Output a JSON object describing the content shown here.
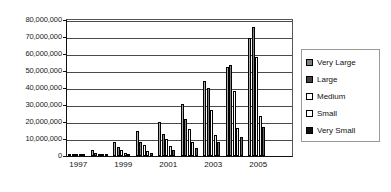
{
  "chart_data": {
    "type": "bar",
    "title": "",
    "subtitle": "",
    "xlabel": "",
    "ylabel": "",
    "grid": true,
    "legend_position": "right",
    "categories": [
      "1997",
      "1998",
      "1999",
      "2000",
      "2001",
      "2002",
      "2003",
      "2004",
      "2005",
      "2006"
    ],
    "tick_labels_shown": [
      "1997",
      "1999",
      "2001",
      "2003",
      "2005"
    ],
    "ylim": [
      0,
      80000000
    ],
    "ytick_values": [
      0,
      10000000,
      20000000,
      30000000,
      40000000,
      50000000,
      60000000,
      70000000,
      80000000
    ],
    "ytick_labels": [
      "0",
      "10,000,000",
      "20,000,000",
      "30,000,000",
      "40,000,000",
      "50,000,000",
      "60,000,000",
      "70,000,000",
      "80,000,000"
    ],
    "series": [
      {
        "name": "Very Large",
        "color": "#7f7f7f",
        "values": [
          1000000,
          3500000,
          8500000,
          14700000,
          20300000,
          30500000,
          44000000,
          52500000,
          69500000,
          0
        ]
      },
      {
        "name": "Large",
        "color": "#404040",
        "values": [
          900000,
          2000000,
          5500000,
          8500000,
          12700000,
          22000000,
          40000000,
          53500000,
          76000000,
          0
        ]
      },
      {
        "name": "Medium",
        "color": "#ffffff",
        "values": [
          700000,
          1400000,
          3300000,
          6500000,
          10300000,
          16000000,
          27000000,
          38000000,
          58000000,
          0
        ]
      },
      {
        "name": "Small",
        "color": "#ffffff",
        "values": [
          500000,
          900000,
          2000000,
          3000000,
          6000000,
          8500000,
          12500000,
          16500000,
          23500000,
          0
        ]
      },
      {
        "name": "Very Small",
        "color": "#111111",
        "values": [
          400000,
          600000,
          1200000,
          2000000,
          3500000,
          5000000,
          8500000,
          11000000,
          17000000,
          0
        ]
      }
    ]
  },
  "legend": {
    "items": [
      {
        "label": "Very Large"
      },
      {
        "label": "Large"
      },
      {
        "label": "Medium"
      },
      {
        "label": "Small"
      },
      {
        "label": "Very Small"
      }
    ]
  }
}
